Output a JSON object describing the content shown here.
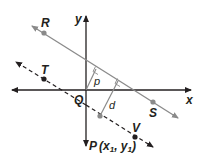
{
  "diagram": {
    "axes": {
      "x_label": "x",
      "y_label": "y",
      "origin_label": "Q"
    },
    "lines": [
      {
        "name": "RS",
        "style": "solid",
        "color": "#8a8a8a",
        "points": [
          "R",
          "S"
        ]
      },
      {
        "name": "TV",
        "style": "dashed",
        "color": "#231f20",
        "points": [
          "T",
          "V"
        ]
      }
    ],
    "points": {
      "R": "R",
      "S": "S",
      "T": "T",
      "V": "V",
      "Q": "Q",
      "P": "P"
    },
    "P_coords": {
      "open": "(",
      "x": "x",
      "x_sub": "1",
      "sep": ", ",
      "y": "y",
      "y_sub": "1",
      "close": ")"
    },
    "segments": {
      "p": "p",
      "d": "d"
    },
    "colors": {
      "axis": "#231f20",
      "solid_line": "#8a8a8a",
      "dashed_line": "#231f20",
      "point_gray": "#8a8a8a",
      "point_dark": "#231f20"
    }
  }
}
